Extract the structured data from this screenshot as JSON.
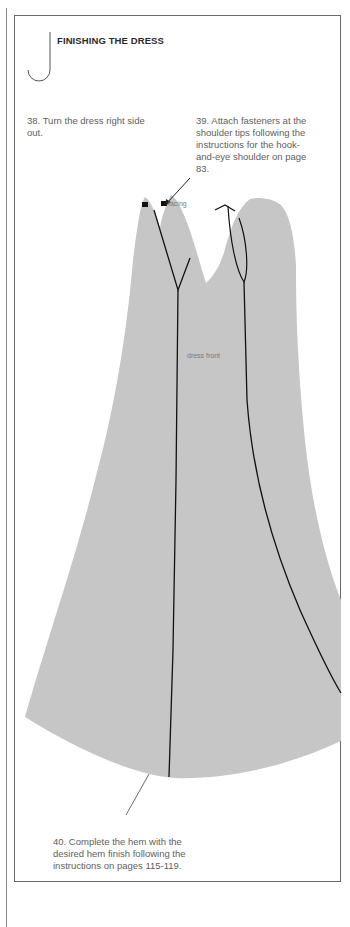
{
  "section": {
    "title": "FINISHING THE DRESS",
    "hook_icon": "j-hook-icon"
  },
  "steps": [
    {
      "number": "38",
      "text": "38. Turn the dress right side out."
    },
    {
      "number": "39",
      "text": "39. Attach fasteners at the shoulder tips following the instructions for the hook-and-eye shoulder on page 83."
    },
    {
      "number": "40",
      "text": "40. Complete the hem with the desired hem finish following the instructions on pages 115-119."
    }
  ],
  "illustration": {
    "labels": {
      "facing": "facing",
      "dress_front": "dress front"
    },
    "fill_color": "#c6c6c6",
    "line_color": "#111111"
  },
  "colors": {
    "border": "#6a6a6a",
    "text": "#606060",
    "title": "#2a2a2a"
  }
}
